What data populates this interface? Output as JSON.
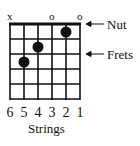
{
  "diagram": {
    "type": "guitar-chord-chart",
    "string_markers": [
      {
        "string": 6,
        "mark": "x"
      },
      {
        "string": 3,
        "mark": "o"
      },
      {
        "string": 1,
        "mark": "o"
      }
    ],
    "string_numbers": [
      "6",
      "5",
      "4",
      "3",
      "2",
      "1"
    ],
    "strings_label": "Strings",
    "annotations": {
      "nut": "Nut",
      "frets": "Frets"
    },
    "finger_positions": [
      {
        "string": 2,
        "fret": 1
      },
      {
        "string": 4,
        "fret": 2
      },
      {
        "string": 5,
        "fret": 3
      }
    ],
    "num_frets": 5,
    "colors": {
      "lines": "#111111",
      "dots": "#111111",
      "background": "#ffffff"
    }
  }
}
